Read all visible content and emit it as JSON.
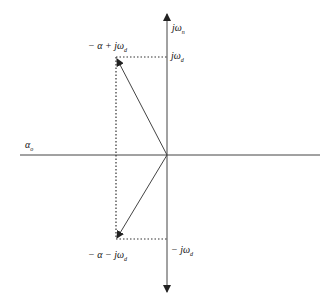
{
  "diagram": {
    "type": "s-plane pole diagram",
    "labels": {
      "imag_axis_top": "jωn",
      "pole_top": "−α + jωd",
      "tick_top": "jωd",
      "real_axis": "αo",
      "pole_bottom": "−α − jωd",
      "tick_bottom": "−jωd"
    },
    "label_parts": {
      "imag_axis_top": {
        "main": "jω",
        "sub": "n"
      },
      "pole_top": {
        "main": "− α + jω",
        "sub": "d"
      },
      "tick_top": {
        "main": "jω",
        "sub": "d"
      },
      "real_axis": {
        "main": "α",
        "sub": "o"
      },
      "pole_bottom": {
        "main": "− α − jω",
        "sub": "d"
      },
      "tick_bottom": {
        "main": "− jω",
        "sub": "d"
      }
    },
    "colors": {
      "line": "#333333",
      "background": "#ffffff"
    }
  }
}
